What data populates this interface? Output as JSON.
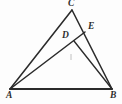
{
  "figure": {
    "kind": "geometry-diagram",
    "background_color": "#fdfdfd",
    "stroke_color": "#2b2b2b",
    "tick_color": "#b9b9b9",
    "canvas": {
      "width": 122,
      "height": 104
    },
    "points": [
      {
        "name": "A",
        "label": "A",
        "x": 10,
        "y": 89,
        "label_x": 6,
        "label_y": 91
      },
      {
        "name": "B",
        "label": "B",
        "x": 112,
        "y": 89,
        "label_x": 110,
        "label_y": 91
      },
      {
        "name": "C",
        "label": "C",
        "x": 72,
        "y": 10,
        "label_x": 68,
        "label_y": -1
      },
      {
        "name": "D",
        "label": "D",
        "x": 74,
        "y": 41,
        "label_x": 62,
        "label_y": 31
      },
      {
        "name": "E",
        "label": "E",
        "x": 85,
        "y": 32,
        "label_x": 88,
        "label_y": 22
      }
    ],
    "segments": [
      {
        "name": "AB",
        "from": "A",
        "to": "B",
        "weight": "thick"
      },
      {
        "name": "AC",
        "from": "A",
        "to": "C",
        "weight": "med"
      },
      {
        "name": "CB",
        "from": "C",
        "to": "B",
        "weight": "med"
      },
      {
        "name": "AE",
        "from": "A",
        "to": "E",
        "weight": "med"
      },
      {
        "name": "DB",
        "from": "D",
        "to": "B",
        "weight": "thin"
      }
    ],
    "marks": [
      {
        "name": "interior-tick",
        "x1": 71,
        "y1": 54,
        "x2": 71,
        "y2": 60
      }
    ],
    "labels": {
      "C": "C",
      "E": "E",
      "D": "D",
      "A": "A",
      "B": "B"
    }
  }
}
